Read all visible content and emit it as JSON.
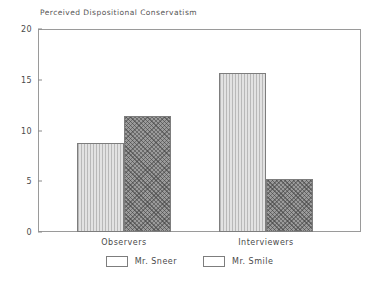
{
  "chart_data": {
    "type": "bar",
    "title": "Perceived Dispositional Conservatism",
    "xlabel": "",
    "ylabel": "",
    "ylim": [
      0,
      20
    ],
    "yticks": [
      "0",
      "5",
      "10",
      "15",
      "20"
    ],
    "ytick_values": [
      0,
      5,
      10,
      15,
      20
    ],
    "grid": false,
    "legend_position": "bottom-center",
    "categories": [
      "Observers",
      "Interviewers"
    ],
    "series": [
      {
        "name": "Mr. Sneer",
        "values": [
          8.8,
          15.7
        ],
        "fill": "#e2e2e2",
        "pattern": "vertical-hatch",
        "edge": "#7d7d7d"
      },
      {
        "name": "Mr. Smile",
        "values": [
          11.4,
          5.2
        ],
        "fill": "#9b9b9b",
        "pattern": "diagonal-crosshatch",
        "edge": "#7d7d7d"
      }
    ]
  },
  "axis": {
    "frame_color": "#9a9a9a",
    "text_color": "#4a4a4a"
  }
}
